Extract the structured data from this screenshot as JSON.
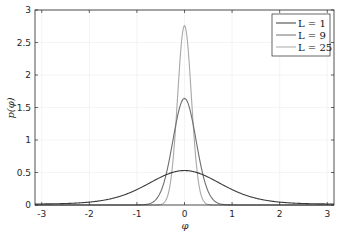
{
  "chart_data": {
    "type": "line",
    "title": "",
    "xlabel": "φ",
    "ylabel": "p(φ)",
    "xlim": [
      -3.1416,
      3.1416
    ],
    "ylim": [
      0,
      3
    ],
    "xticks": [
      "-3",
      "-2",
      "-1",
      "0",
      "1",
      "2",
      "3"
    ],
    "xtick_values": [
      -3,
      -2,
      -1,
      0,
      1,
      2,
      3
    ],
    "yticks": [
      "0",
      "0.5",
      "1",
      "1.5",
      "2",
      "2.5",
      "3"
    ],
    "ytick_values": [
      0,
      0.5,
      1,
      1.5,
      2,
      2.5,
      3
    ],
    "grid": true,
    "legend_position": "upper right",
    "x": [
      -3.0,
      -2.0,
      -1.0,
      -0.5,
      -0.25,
      0,
      0.25,
      0.5,
      1.0,
      2.0,
      3.0
    ],
    "series": [
      {
        "name": "L = 1",
        "legend_label": "L = 1",
        "color": "#3a3a3a",
        "kappa": 1.75,
        "peak": 0.53,
        "values": [
          0.03,
          0.06,
          0.22,
          0.4,
          0.49,
          0.53,
          0.49,
          0.4,
          0.22,
          0.06,
          0.03
        ]
      },
      {
        "name": "L = 9",
        "legend_label": "L = 9",
        "color": "#6e6e6e",
        "kappa": 17,
        "peak": 1.64,
        "values": [
          0.0,
          0.0,
          0.0,
          0.19,
          1.0,
          1.64,
          1.0,
          0.19,
          0.0,
          0.0,
          0.0
        ]
      },
      {
        "name": "L = 25",
        "legend_label": "L = 25",
        "color": "#a8a8a8",
        "kappa": 48,
        "peak": 2.76,
        "values": [
          0.0,
          0.0,
          0.0,
          0.01,
          0.61,
          2.76,
          0.61,
          0.01,
          0.0,
          0.0,
          0.0
        ]
      }
    ]
  }
}
